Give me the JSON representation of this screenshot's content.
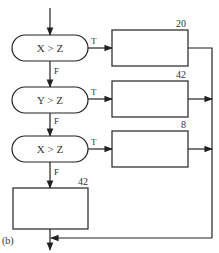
{
  "figure_label": "(b)",
  "decisions": [
    {
      "condition": "X > Z",
      "true_label": "T",
      "false_label": "F"
    },
    {
      "condition": "Y > Z",
      "true_label": "T",
      "false_label": "F"
    },
    {
      "condition": "X > Z",
      "true_label": "T",
      "false_label": "F"
    }
  ],
  "boxes": [
    {
      "value": "20"
    },
    {
      "value": "42"
    },
    {
      "value": "8"
    },
    {
      "value": "42"
    }
  ],
  "colors": {
    "line": "#222222",
    "text": "#333333",
    "background": "#ffffff"
  }
}
